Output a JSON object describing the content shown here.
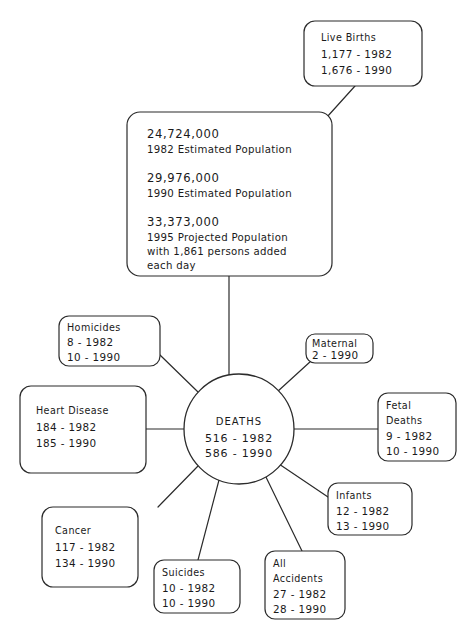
{
  "diagram": {
    "stroke_color": "#2b2b2b",
    "text_color": "#1a1a1a",
    "background": "#ffffff"
  },
  "live_births": {
    "label": "Live Births",
    "line1": "1,177 - 1982",
    "line2": "1,676 - 1990"
  },
  "population": {
    "num1": "24,724,000",
    "cap1": "1982 Estimated Population",
    "num2": "29,976,000",
    "cap2": "1990 Estimated Population",
    "num3": "33,373,000",
    "cap3": "1995 Projected Population",
    "cap4": "with 1,861 persons added",
    "cap5": "each day"
  },
  "hub": {
    "label": "DEATHS",
    "line1": "516 - 1982",
    "line2": "586 - 1990"
  },
  "causes": [
    {
      "name": "homicides",
      "label1": "Homicides",
      "label2": "",
      "line1": "8 - 1982",
      "line2": "10 - 1990"
    },
    {
      "name": "heart-disease",
      "label1": "Heart Disease",
      "label2": "",
      "line1": "184 - 1982",
      "line2": "185 - 1990"
    },
    {
      "name": "cancer",
      "label1": "Cancer",
      "label2": "",
      "line1": "117 - 1982",
      "line2": "134 - 1990"
    },
    {
      "name": "suicides",
      "label1": "Suicides",
      "label2": "",
      "line1": "10 - 1982",
      "line2": "10 - 1990"
    },
    {
      "name": "all-accidents",
      "label1": "All",
      "label2": "Accidents",
      "line1": "27 - 1982",
      "line2": "28 - 1990"
    },
    {
      "name": "infants",
      "label1": "Infants",
      "label2": "",
      "line1": "12 - 1982",
      "line2": "13 - 1990"
    },
    {
      "name": "fetal-deaths",
      "label1": "Fetal",
      "label2": "Deaths",
      "line1": "9 - 1982",
      "line2": "10 - 1990"
    },
    {
      "name": "maternal",
      "label1": "Maternal",
      "label2": "",
      "line1": "2 - 1990",
      "line2": ""
    }
  ]
}
